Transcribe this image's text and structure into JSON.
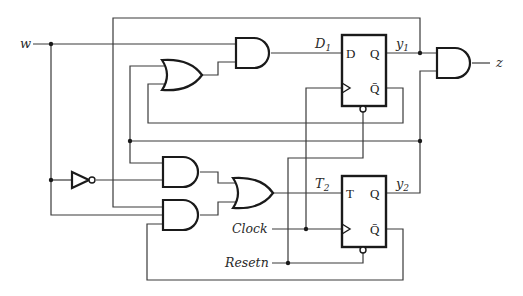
{
  "diagram": {
    "type": "sequential-circuit",
    "inputs": {
      "w": "w",
      "clock": "Clock",
      "resetn": "Resetn"
    },
    "outputs": {
      "z": "z"
    },
    "signals": {
      "d1": "D",
      "d1_sub": "1",
      "t2": "T",
      "t2_sub": "2",
      "y1": "y",
      "y1_sub": "1",
      "y2": "y",
      "y2_sub": "2"
    },
    "flipflops": [
      {
        "name": "D flip-flop",
        "input_pin": "D",
        "q_pin": "Q",
        "qbar_pin": "Q̄"
      },
      {
        "name": "T flip-flop",
        "input_pin": "T",
        "q_pin": "Q",
        "qbar_pin": "Q̄"
      }
    ],
    "gates": [
      "AND (D1)",
      "OR (D1 feedback)",
      "NOT (w)",
      "AND (T2 upper)",
      "AND (T2 lower)",
      "OR (T2)",
      "AND (z)"
    ],
    "colors": {
      "line": "#3a3a3a",
      "gate": "#1a1a1a",
      "background": "#ffffff"
    }
  }
}
